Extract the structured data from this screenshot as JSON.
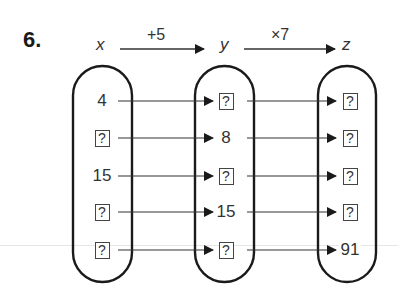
{
  "question_number": "6.",
  "header": {
    "var_x": "x",
    "var_y": "y",
    "var_z": "z",
    "op_xy": "+5",
    "op_yz": "×7"
  },
  "columns": {
    "x": [
      "4",
      "?",
      "15",
      "?",
      "?"
    ],
    "y": [
      "?",
      "8",
      "?",
      "15",
      "?"
    ],
    "z": [
      "?",
      "?",
      "?",
      "?",
      "91"
    ]
  },
  "mapping": {
    "rule": "y = x + 5, z = y × 7",
    "rows": 5
  }
}
